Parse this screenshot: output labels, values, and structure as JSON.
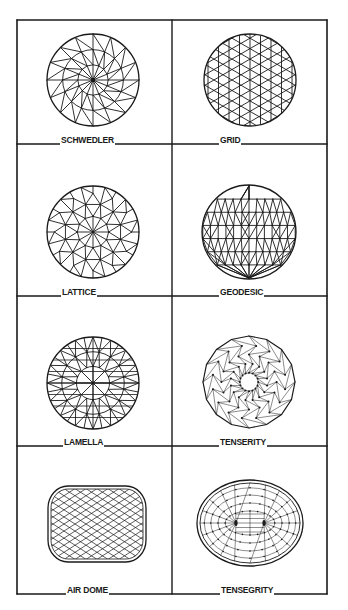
{
  "figure": {
    "colors": {
      "ink": "#1a1a1a",
      "paper": "#ffffff"
    },
    "frame": {
      "left": 17,
      "right": 327,
      "mid": 172,
      "rows_y": [
        20,
        144,
        296,
        446,
        594
      ]
    },
    "panels": [
      {
        "id": "schwedler",
        "label": "SCHWEDLER",
        "label_x": 60,
        "row": 0,
        "col": 0,
        "type": "schwedler",
        "cx": 93,
        "cy": 80,
        "r": 46
      },
      {
        "id": "grid",
        "label": "GRID",
        "label_x": 219,
        "row": 0,
        "col": 1,
        "type": "grid",
        "cx": 250,
        "cy": 80,
        "r": 46
      },
      {
        "id": "lattice",
        "label": "LATTICE",
        "label_x": 61,
        "row": 1,
        "col": 0,
        "type": "lattice",
        "cx": 93,
        "cy": 232,
        "r": 46
      },
      {
        "id": "geodesic",
        "label": "GEODESIC",
        "label_x": 219,
        "row": 1,
        "col": 1,
        "type": "geodesic",
        "cx": 249,
        "cy": 232,
        "r": 47
      },
      {
        "id": "lamella",
        "label": "LAMELLA",
        "label_x": 63,
        "row": 2,
        "col": 0,
        "type": "lamella",
        "cx": 93,
        "cy": 383,
        "r": 46
      },
      {
        "id": "tenserity",
        "label": "TENSERITY",
        "label_x": 219,
        "row": 2,
        "col": 1,
        "type": "tenserity",
        "cx": 249,
        "cy": 382,
        "r": 46
      },
      {
        "id": "air-dome",
        "label": "AIR DOME",
        "label_x": 66,
        "row": 3,
        "col": 0,
        "type": "airdome",
        "cx": 97,
        "cy": 524,
        "w": 98,
        "h": 76
      },
      {
        "id": "tensegrity",
        "label": "TENSEGRITY",
        "label_x": 220,
        "row": 3,
        "col": 1,
        "type": "tensegrity",
        "cx": 250,
        "cy": 523,
        "rx": 53,
        "ry": 43
      }
    ]
  }
}
